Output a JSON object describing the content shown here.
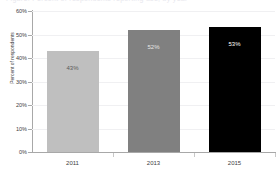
{
  "title_remnant": "Figure: Percent of respondents reporting use, by year",
  "chart_data": {
    "type": "bar",
    "title": "",
    "xlabel": "",
    "ylabel": "Percent of respondents",
    "categories": [
      "2011",
      "2013",
      "2015"
    ],
    "values": [
      43,
      52,
      53
    ],
    "value_labels": [
      "43%",
      "52%",
      "53%"
    ],
    "ylim": [
      0,
      60
    ],
    "yticks": [
      0,
      10,
      20,
      30,
      40,
      50,
      60
    ],
    "ytick_labels": [
      "0%",
      "10%",
      "20%",
      "30%",
      "40%",
      "50%",
      "60%"
    ],
    "grid": true,
    "legend": "none",
    "bar_colors": [
      "#bfbfbf",
      "#808080",
      "#000000"
    ],
    "label_colors": [
      "#5a5a5a",
      "#e6e6e6",
      "#ffffff"
    ]
  }
}
